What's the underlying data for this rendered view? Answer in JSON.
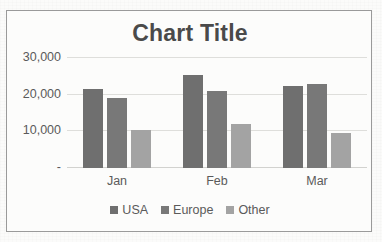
{
  "chart_data": {
    "type": "bar",
    "title": "Chart Title",
    "xlabel": "",
    "ylabel": "",
    "categories": [
      "Jan",
      "Feb",
      "Mar"
    ],
    "series": [
      {
        "name": "USA",
        "values": [
          21500,
          25500,
          22500
        ],
        "color": "#6f6f6f"
      },
      {
        "name": "Europe",
        "values": [
          19000,
          21000,
          23000
        ],
        "color": "#787878"
      },
      {
        "name": "Other",
        "values": [
          10500,
          12000,
          9500
        ],
        "color": "#a3a3a3"
      }
    ],
    "ylim": [
      0,
      30000
    ],
    "ytick_values": [
      0,
      10000,
      20000,
      30000
    ],
    "ytick_labels": [
      "-",
      "10,000",
      "20,000",
      "30,000"
    ],
    "grid": true,
    "legend_position": "bottom"
  },
  "title": {
    "text": "Chart Title"
  },
  "yaxis": {
    "ticks": [
      {
        "label": "30,000",
        "value": 30000
      },
      {
        "label": "20,000",
        "value": 20000
      },
      {
        "label": "10,000",
        "value": 10000
      },
      {
        "label": "-",
        "value": 0
      }
    ]
  },
  "xaxis": {
    "labels": [
      "Jan",
      "Feb",
      "Mar"
    ]
  },
  "legend": {
    "items": [
      {
        "label": "USA"
      },
      {
        "label": "Europe"
      },
      {
        "label": "Other"
      }
    ]
  }
}
